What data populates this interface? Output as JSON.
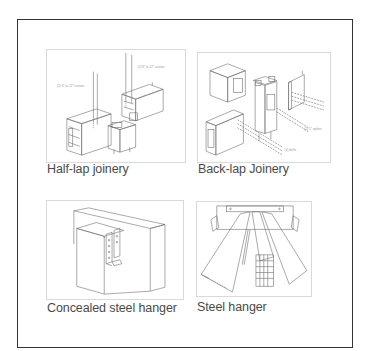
{
  "figure": {
    "panels": [
      {
        "id": "half-lap",
        "caption": "Half-lap joinery",
        "illustration": "half-lap-joinery-diagram",
        "annotations": [
          "(2) 8\" to 12\" screws",
          "(2) 8\" to 12\" screws"
        ]
      },
      {
        "id": "back-lap",
        "caption": "Back-lap Joinery",
        "illustration": "back-lap-joinery-diagram",
        "annotations": [
          "(2) 5\" spikes",
          "(4) drifts"
        ]
      },
      {
        "id": "concealed-hanger",
        "caption": "Concealed steel hanger",
        "illustration": "concealed-steel-hanger-diagram"
      },
      {
        "id": "steel-hanger",
        "caption": "Steel hanger",
        "illustration": "steel-hanger-diagram"
      }
    ]
  },
  "colors": {
    "frame_border": "#333333",
    "image_border": "#d9d9d9",
    "line_art": "#6e6e6e",
    "caption_text": "#4a4a4a"
  }
}
